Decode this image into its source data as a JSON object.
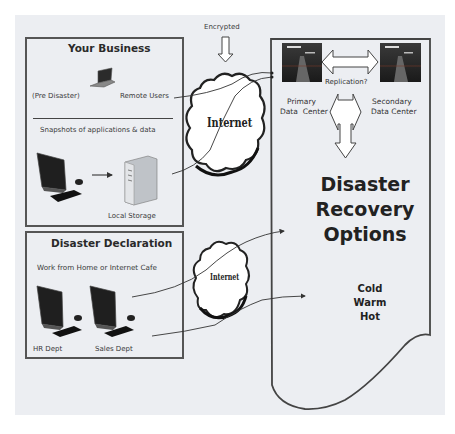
{
  "encrypted_label": "Encrypted",
  "your_business": {
    "title": "Your Business",
    "pre_disaster": "(Pre Disaster)",
    "remote_users": "Remote Users",
    "snapshots": "Snapshots of applications & data",
    "local_storage": "Local Storage",
    "icons": [
      "laptop-icon",
      "desktop-computer-icon",
      "server-tower-icon"
    ]
  },
  "disaster_declaration": {
    "title": "Disaster Declaration",
    "subtitle": "Work from Home or Internet Cafe",
    "departments": [
      "HR Dept",
      "Sales Dept"
    ],
    "icons": [
      "desktop-computer-icon",
      "desktop-computer-icon"
    ]
  },
  "internet_clouds": [
    "Internet",
    "Internet"
  ],
  "data_centers": {
    "replication": "Replication?",
    "primary": [
      "Primary",
      "Data  Center"
    ],
    "secondary": [
      "Secondary",
      "Data Center"
    ]
  },
  "recovery": {
    "title_lines": [
      "Disaster",
      "Recovery",
      "Options"
    ],
    "options": [
      "Cold",
      "Warm",
      "Hot"
    ]
  },
  "colors": {
    "background": "#eceef2",
    "border": "#555555",
    "cloud_fill": "#ffffff",
    "text": "#333333"
  }
}
